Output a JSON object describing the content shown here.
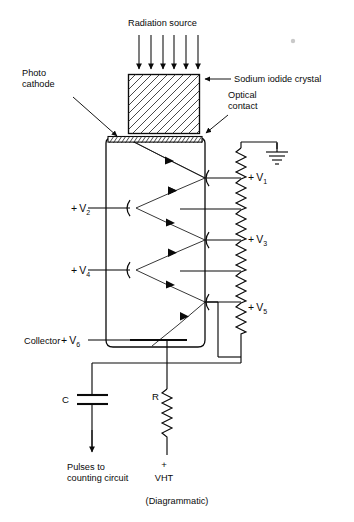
{
  "figure": {
    "caption": "(Diagrammatic)"
  },
  "labels": {
    "radiation_source": "Radiation source",
    "photo_cathode_line1": "Photo",
    "photo_cathode_line2": "cathode",
    "sodium_iodide_crystal": "Sodium iodide crystal",
    "optical_contact_line1": "Optical",
    "optical_contact_line2": "contact",
    "collector": "Collector",
    "capacitor": "C",
    "resistor": "R",
    "vht_sign": "+",
    "vht": "VHT",
    "pulses_line1": "Pulses to",
    "pulses_line2": "counting circuit"
  },
  "voltages": [
    {
      "sign": "+",
      "symbol": "V",
      "index": "1",
      "text": "+ V1"
    },
    {
      "sign": "+",
      "symbol": "V",
      "index": "2",
      "text": "+ V2"
    },
    {
      "sign": "+",
      "symbol": "V",
      "index": "3",
      "text": "+ V3"
    },
    {
      "sign": "+",
      "symbol": "V",
      "index": "4",
      "text": "+ V4"
    },
    {
      "sign": "+",
      "symbol": "V",
      "index": "5",
      "text": "+ V5"
    },
    {
      "sign": "+",
      "symbol": "V",
      "index": "6",
      "text": "+ V6"
    }
  ],
  "icons": {
    "radiation_arrows": "down-arrow-icon",
    "ground": "ground-icon",
    "resistor_chain": "resistor-zigzag-icon",
    "capacitor": "capacitor-icon",
    "dynode": "dynode-arc-icon",
    "electron_arrow": "electron-path-arrow-icon",
    "output_arrow": "down-arrow-icon",
    "pointer_crystal": "left-arrow-pointer-icon",
    "pointer_optical": "diagonal-pointer-icon",
    "pointer_cathode": "diagonal-pointer-icon"
  },
  "colors": {
    "ink": "#0a0a0a",
    "background": "#ffffff",
    "hatch": "#1b1b1b",
    "speck": "#c9c9c9"
  },
  "counts": {
    "radiation_arrows": 6,
    "dynodes": 5,
    "resistor_segments": 6
  }
}
